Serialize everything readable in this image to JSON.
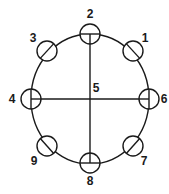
{
  "diagram": {
    "type": "circular-pin-layout",
    "outline": {
      "cx": 90,
      "cy": 99,
      "rx": 59,
      "ry": 65
    },
    "center_label": {
      "text": "5",
      "x": 96,
      "y": 92
    },
    "pins": [
      {
        "id": "1",
        "label": "1",
        "cx": 133,
        "cy": 51,
        "lx": 145,
        "ly": 42
      },
      {
        "id": "2",
        "label": "2",
        "cx": 90,
        "cy": 34,
        "lx": 90,
        "ly": 18
      },
      {
        "id": "3",
        "label": "3",
        "cx": 47,
        "cy": 51,
        "lx": 33,
        "ly": 42
      },
      {
        "id": "4",
        "label": "4",
        "cx": 31,
        "cy": 99,
        "lx": 12,
        "ly": 103
      },
      {
        "id": "6",
        "label": "6",
        "cx": 149,
        "cy": 99,
        "lx": 164,
        "ly": 103
      },
      {
        "id": "7",
        "label": "7",
        "cx": 133,
        "cy": 146,
        "lx": 144,
        "ly": 165
      },
      {
        "id": "8",
        "label": "8",
        "cx": 90,
        "cy": 163,
        "lx": 90,
        "ly": 185
      },
      {
        "id": "9",
        "label": "9",
        "cx": 47,
        "cy": 146,
        "lx": 34,
        "ly": 165
      }
    ],
    "pin_radius": 10,
    "color": "#1a1a1a"
  }
}
